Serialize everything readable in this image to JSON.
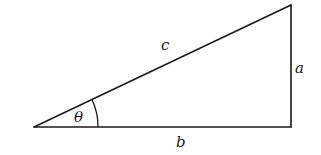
{
  "figure": {
    "type": "right-triangle",
    "vertices": {
      "angle_vertex": [
        34,
        127
      ],
      "right_angle_vertex": [
        291,
        127
      ],
      "top_vertex": [
        291,
        5
      ]
    },
    "labels": {
      "hypotenuse": "c",
      "opposite": "a",
      "adjacent": "b",
      "angle": "θ"
    },
    "colors": {
      "stroke": "#1a1a1a",
      "background": "#ffffff"
    }
  }
}
